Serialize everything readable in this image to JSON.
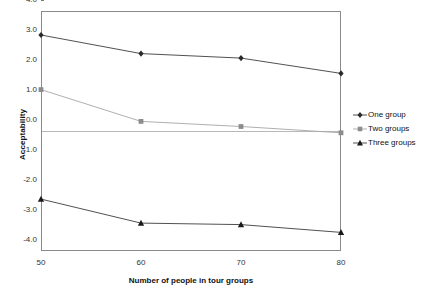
{
  "chart_data": {
    "type": "line",
    "title": "",
    "subtitle": "",
    "xlabel": "Number of people in tour groups",
    "ylabel": "Acceptability",
    "categories": [
      "50",
      "60",
      "70",
      "80"
    ],
    "x": [
      50,
      60,
      70,
      80
    ],
    "xlim": [
      50,
      80
    ],
    "ylim": [
      -4.0,
      4.0
    ],
    "yticks": [
      "4.0",
      "3.0",
      "2.0",
      "1.0",
      "0.0",
      "-1.0",
      "-2.0",
      "-3.0",
      "-4.0"
    ],
    "ytick_values": [
      4.0,
      3.0,
      2.0,
      1.0,
      0.0,
      -1.0,
      -2.0,
      -3.0,
      -4.0
    ],
    "grid": false,
    "zero_line": true,
    "legend_position": "right",
    "series": [
      {
        "name": "One group",
        "marker": "diamond",
        "color": "#2a2a2a",
        "line_color": "#3d3d3d",
        "values": [
          3.2,
          2.58,
          2.43,
          1.92
        ]
      },
      {
        "name": "Two groups",
        "marker": "square",
        "color": "#8c8c8c",
        "line_color": "#a6a6a6",
        "values": [
          1.38,
          0.32,
          0.15,
          -0.06
        ]
      },
      {
        "name": "Three groups",
        "marker": "triangle",
        "color": "#1a1a1a",
        "line_color": "#3d3d3d",
        "values": [
          -2.27,
          -3.07,
          -3.12,
          -3.38
        ]
      }
    ]
  },
  "axes": {
    "y_title": "Acceptability",
    "x_title": "Number of people in tour groups"
  },
  "legend": {
    "entries": [
      {
        "label": "One group",
        "icon": "diamond-marker-icon"
      },
      {
        "label": "Two groups",
        "icon": "square-marker-icon"
      },
      {
        "label": "Three groups",
        "icon": "triangle-marker-icon"
      }
    ]
  }
}
